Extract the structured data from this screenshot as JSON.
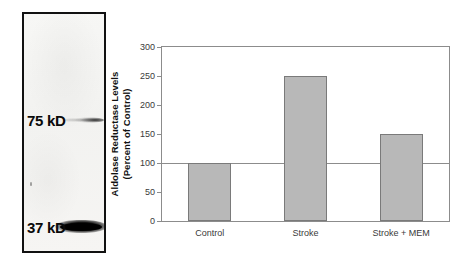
{
  "figure": {
    "blot": {
      "panel_name": "western-blot",
      "markers": [
        {
          "label": "75 kD",
          "band_intensity": "faint"
        },
        {
          "label": "37 kD",
          "band_intensity": "strong"
        }
      ]
    }
  },
  "chart_data": {
    "type": "bar",
    "title": "",
    "xlabel": "",
    "ylabel_lines": [
      "Aldolase Reductase Levels",
      "(Percent of Control)"
    ],
    "ylabel": "Aldolase Reductase Levels (Percent of Control)",
    "categories": [
      "Control",
      "Stroke",
      "Stroke + MEM"
    ],
    "values": [
      100,
      250,
      150
    ],
    "ylim": [
      0,
      300
    ],
    "yticks": [
      0,
      50,
      100,
      150,
      200,
      250,
      300
    ],
    "ytick_labels": [
      "0",
      "50",
      "100",
      "150",
      "200",
      "250",
      "300"
    ],
    "grid": false,
    "legend": null,
    "reference_lines": [
      {
        "value": 100,
        "label": "",
        "style": "solid"
      }
    ],
    "bar_color": "#b8b8b8",
    "bar_edge_color": "#7a7a7a",
    "axis_color": "#8c8c8c"
  }
}
